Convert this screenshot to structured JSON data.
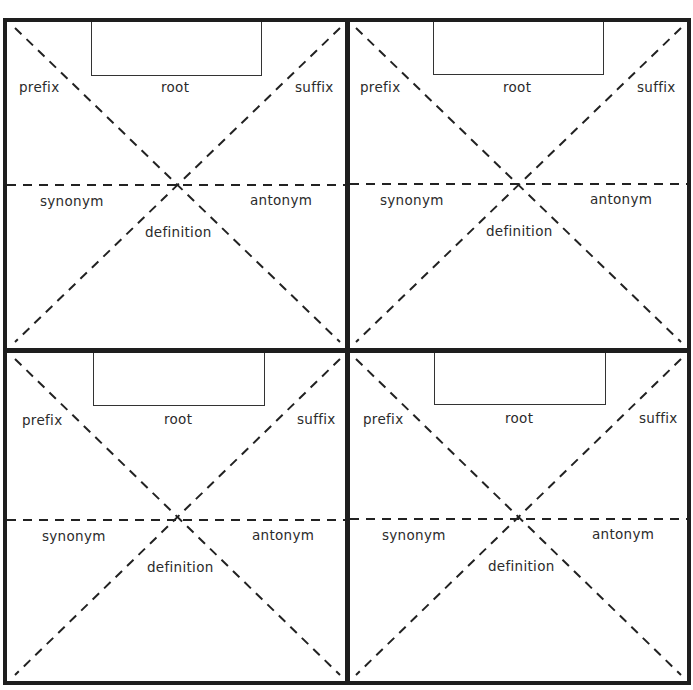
{
  "worksheet": {
    "type": "word-map-frayer-grid",
    "quadrants": [
      {
        "id": "top-left",
        "labels": {
          "prefix": "prefix",
          "root": "root",
          "suffix": "suffix",
          "synonym": "synonym",
          "antonym": "antonym",
          "definition": "definition"
        },
        "root_box_value": ""
      },
      {
        "id": "top-right",
        "labels": {
          "prefix": "prefix",
          "root": "root",
          "suffix": "suffix",
          "synonym": "synonym",
          "antonym": "antonym",
          "definition": "definition"
        },
        "root_box_value": ""
      },
      {
        "id": "bottom-left",
        "labels": {
          "prefix": "prefix",
          "root": "root",
          "suffix": "suffix",
          "synonym": "synonym",
          "antonym": "antonym",
          "definition": "definition"
        },
        "root_box_value": ""
      },
      {
        "id": "bottom-right",
        "labels": {
          "prefix": "prefix",
          "root": "root",
          "suffix": "suffix",
          "synonym": "synonym",
          "antonym": "antonym",
          "definition": "definition"
        },
        "root_box_value": ""
      }
    ]
  },
  "colors": {
    "line": "#1e1e1e",
    "text": "#2b2b2b",
    "background": "#ffffff"
  }
}
